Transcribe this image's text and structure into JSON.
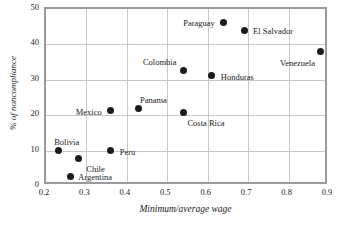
{
  "chart_data": {
    "type": "scatter",
    "title": "",
    "xlabel": "Minimum/average wage",
    "ylabel": "% of noncompliance",
    "xlim": [
      0.2,
      0.9
    ],
    "ylim": [
      0,
      50
    ],
    "xticks": [
      "0.2",
      "0.3",
      "0.4",
      "0.5",
      "0.6",
      "0.7",
      "0.8",
      "0.9"
    ],
    "xtick_values": [
      0.2,
      0.3,
      0.4,
      0.5,
      0.6,
      0.7,
      0.8,
      0.9
    ],
    "yticks": [
      "0",
      "10",
      "20",
      "30",
      "40",
      "50"
    ],
    "ytick_values": [
      0,
      10,
      20,
      30,
      40,
      50
    ],
    "grid": true,
    "legend": "none",
    "point_color": "#1b1b1b",
    "frame_color": "#9a9a9a",
    "grid_color": "#c8c8c8",
    "points": [
      {
        "label": "Bolivia",
        "x": 0.23,
        "y": 10.0,
        "label_dx": -4,
        "label_dy": -13,
        "label_anchor": "left"
      },
      {
        "label": "Argentina",
        "x": 0.26,
        "y": 2.7,
        "label_dx": 8,
        "label_dy": -3,
        "label_anchor": "left"
      },
      {
        "label": "Chile",
        "x": 0.28,
        "y": 7.7,
        "label_dx": 8,
        "label_dy": 6,
        "label_anchor": "left"
      },
      {
        "label": "Mexico",
        "x": 0.36,
        "y": 21.3,
        "label_dx": -9,
        "label_dy": -3,
        "label_anchor": "right"
      },
      {
        "label": "Peru",
        "x": 0.36,
        "y": 10.0,
        "label_dx": 9,
        "label_dy": -3,
        "label_anchor": "left"
      },
      {
        "label": "Panama",
        "x": 0.43,
        "y": 21.8,
        "label_dx": 1,
        "label_dy": -13,
        "label_anchor": "left"
      },
      {
        "label": "Costa Rica",
        "x": 0.54,
        "y": 20.8,
        "label_dx": 4,
        "label_dy": 7,
        "label_anchor": "left"
      },
      {
        "label": "Colombia",
        "x": 0.54,
        "y": 32.5,
        "label_dx": -7,
        "label_dy": -13,
        "label_anchor": "right"
      },
      {
        "label": "Honduras",
        "x": 0.61,
        "y": 31.1,
        "label_dx": 9,
        "label_dy": -3,
        "label_anchor": "left"
      },
      {
        "label": "Paraguay",
        "x": 0.64,
        "y": 46.3,
        "label_dx": -9,
        "label_dy": -3,
        "label_anchor": "right"
      },
      {
        "label": "El Salvador",
        "x": 0.69,
        "y": 44.0,
        "label_dx": 9,
        "label_dy": -3,
        "label_anchor": "left"
      },
      {
        "label": "Venezuela",
        "x": 0.88,
        "y": 37.9,
        "label_dx": -6,
        "label_dy": 7,
        "label_anchor": "right"
      }
    ]
  }
}
